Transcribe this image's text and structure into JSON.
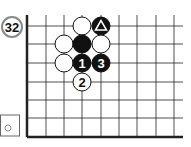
{
  "problem": {
    "number": "32",
    "label_color": "#888888"
  },
  "board": {
    "x_lines": [
      27,
      46,
      64,
      82,
      101,
      119,
      137,
      156,
      174
    ],
    "y_lines": [
      26,
      44,
      63,
      82,
      100,
      118,
      137
    ],
    "top_edge_y": 15,
    "right_edge_x": 183,
    "left_edge_thick": true,
    "bottom_edge_thick": true,
    "stone_radius": 9
  },
  "stones": [
    {
      "color": "white",
      "col": 3,
      "row": 0,
      "label": ""
    },
    {
      "color": "black",
      "col": 4,
      "row": 0,
      "label": "",
      "mark": "triangle"
    },
    {
      "color": "white",
      "col": 2,
      "row": 1,
      "label": ""
    },
    {
      "color": "black",
      "col": 3,
      "row": 1,
      "label": ""
    },
    {
      "color": "white",
      "col": 4,
      "row": 1,
      "label": ""
    },
    {
      "color": "white",
      "col": 2,
      "row": 2,
      "label": ""
    },
    {
      "color": "black",
      "col": 3,
      "row": 2,
      "label": "1"
    },
    {
      "color": "black",
      "col": 4,
      "row": 2,
      "label": "3"
    },
    {
      "color": "white",
      "col": 3,
      "row": 3,
      "label": "2"
    }
  ],
  "to_play_box": {
    "symbol": "white-stone",
    "meaning": "White to play"
  }
}
